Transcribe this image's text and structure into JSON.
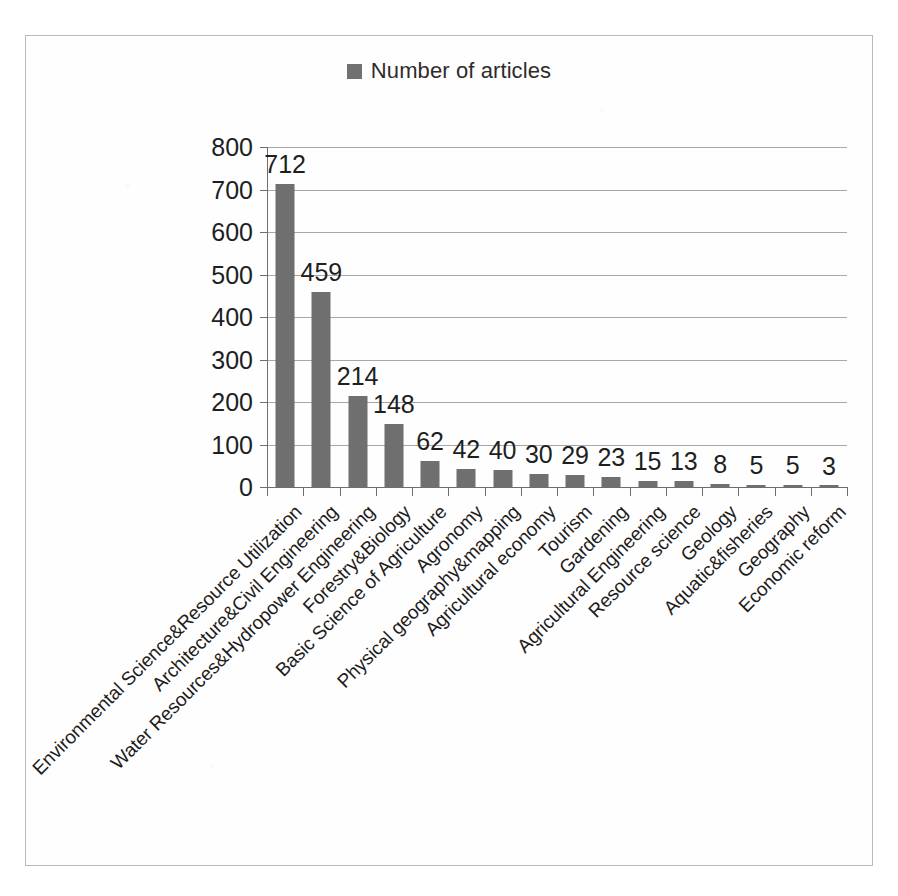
{
  "legend": {
    "label": "Number of articles",
    "swatch_color": "#73716f",
    "marker_icon": "square-marker-icon",
    "position": "top-center"
  },
  "axis": {
    "y_ticks": [
      "0",
      "100",
      "200",
      "300",
      "400",
      "500",
      "600",
      "700",
      "800"
    ]
  },
  "chart_data": {
    "type": "bar",
    "title": "",
    "subtitle": "",
    "xlabel": "",
    "ylabel": "",
    "ylim": [
      0,
      800
    ],
    "y_tick_step": 100,
    "grid": true,
    "legend_position": "top-center",
    "series_name": "Number of articles",
    "bar_color": "#706f6f",
    "categories": [
      "Environmental Science&Resource Utilization",
      "Architecture&Civil Engineering",
      "Water Resources&Hydropower Engineering",
      "Forestry&Biology",
      "Basic Science of Agriculture",
      "Agronomy",
      "Physical geography&mapping",
      "Agricultural economy",
      "Tourism",
      "Gardening",
      "Agricultural Engineering",
      "Resource science",
      "Geology",
      "Aquatic&fisheries",
      "Geography",
      "Economic reform"
    ],
    "values": [
      712,
      459,
      214,
      148,
      62,
      42,
      40,
      30,
      29,
      23,
      15,
      13,
      8,
      5,
      5,
      3
    ],
    "data_labels": [
      "712",
      "459",
      "214",
      "148",
      "62",
      "42",
      "40",
      "30",
      "29",
      "23",
      "15",
      "13",
      "8",
      "5",
      "5",
      "3"
    ]
  }
}
